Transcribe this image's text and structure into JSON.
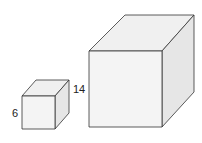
{
  "diagram": {
    "type": "two-cubes-comparison",
    "small_cube": {
      "side_label": "6"
    },
    "large_cube": {
      "side_label": "14"
    },
    "colors": {
      "stroke": "#333333",
      "front_face": "#f4f4f4",
      "top_face": "#f0f0f0",
      "side_face": "#e6e6e6"
    }
  }
}
